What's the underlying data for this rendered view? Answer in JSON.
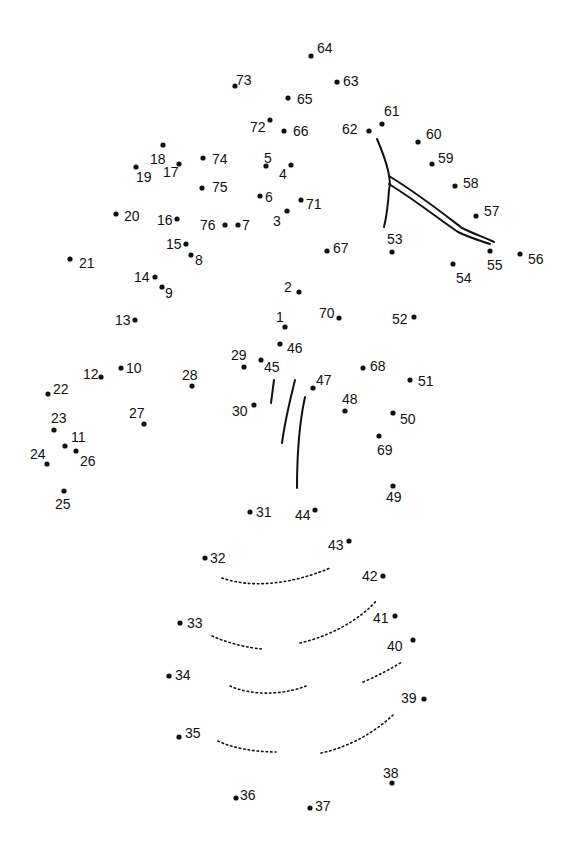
{
  "puzzle": {
    "type": "connect-the-dots",
    "subject_hint": "pineapple",
    "dots": [
      {
        "n": "1",
        "x": 285,
        "y": 327,
        "lx": 276,
        "ly": 322
      },
      {
        "n": "2",
        "x": 299,
        "y": 292,
        "lx": 284,
        "ly": 292
      },
      {
        "n": "3",
        "x": 287,
        "y": 211,
        "lx": 273,
        "ly": 226
      },
      {
        "n": "4",
        "x": 291,
        "y": 165,
        "lx": 279,
        "ly": 179
      },
      {
        "n": "5",
        "x": 266,
        "y": 166,
        "lx": 264,
        "ly": 163
      },
      {
        "n": "6",
        "x": 260,
        "y": 196,
        "lx": 265,
        "ly": 202
      },
      {
        "n": "7",
        "x": 238,
        "y": 225,
        "lx": 242,
        "ly": 230
      },
      {
        "n": "8",
        "x": 191,
        "y": 255,
        "lx": 195,
        "ly": 265
      },
      {
        "n": "9",
        "x": 162,
        "y": 287,
        "lx": 165,
        "ly": 298
      },
      {
        "n": "10",
        "x": 121,
        "y": 368,
        "lx": 126,
        "ly": 373
      },
      {
        "n": "11",
        "x": 65,
        "y": 446,
        "lx": 71,
        "ly": 442
      },
      {
        "n": "12",
        "x": 101,
        "y": 377,
        "lx": 83,
        "ly": 379
      },
      {
        "n": "13",
        "x": 135,
        "y": 320,
        "lx": 115,
        "ly": 325
      },
      {
        "n": "14",
        "x": 155,
        "y": 277,
        "lx": 134,
        "ly": 282
      },
      {
        "n": "15",
        "x": 186,
        "y": 244,
        "lx": 166,
        "ly": 249
      },
      {
        "n": "16",
        "x": 177,
        "y": 219,
        "lx": 157,
        "ly": 225
      },
      {
        "n": "17",
        "x": 179,
        "y": 164,
        "lx": 163,
        "ly": 177
      },
      {
        "n": "18",
        "x": 163,
        "y": 145,
        "lx": 150,
        "ly": 164
      },
      {
        "n": "19",
        "x": 136,
        "y": 167,
        "lx": 136,
        "ly": 182
      },
      {
        "n": "20",
        "x": 116,
        "y": 214,
        "lx": 124,
        "ly": 221
      },
      {
        "n": "21",
        "x": 70,
        "y": 259,
        "lx": 79,
        "ly": 268
      },
      {
        "n": "22",
        "x": 48,
        "y": 394,
        "lx": 53,
        "ly": 394
      },
      {
        "n": "23",
        "x": 54,
        "y": 430,
        "lx": 51,
        "ly": 423
      },
      {
        "n": "24",
        "x": 47,
        "y": 464,
        "lx": 30,
        "ly": 459
      },
      {
        "n": "25",
        "x": 64,
        "y": 491,
        "lx": 55,
        "ly": 509
      },
      {
        "n": "26",
        "x": 76,
        "y": 451,
        "lx": 80,
        "ly": 466
      },
      {
        "n": "27",
        "x": 144,
        "y": 424,
        "lx": 129,
        "ly": 418
      },
      {
        "n": "28",
        "x": 192,
        "y": 386,
        "lx": 182,
        "ly": 380
      },
      {
        "n": "29",
        "x": 244,
        "y": 367,
        "lx": 231,
        "ly": 360
      },
      {
        "n": "30",
        "x": 254,
        "y": 405,
        "lx": 232,
        "ly": 416
      },
      {
        "n": "31",
        "x": 250,
        "y": 512,
        "lx": 256,
        "ly": 517
      },
      {
        "n": "32",
        "x": 205,
        "y": 558,
        "lx": 210,
        "ly": 563
      },
      {
        "n": "33",
        "x": 180,
        "y": 623,
        "lx": 187,
        "ly": 628
      },
      {
        "n": "34",
        "x": 169,
        "y": 676,
        "lx": 175,
        "ly": 680
      },
      {
        "n": "35",
        "x": 179,
        "y": 737,
        "lx": 185,
        "ly": 738
      },
      {
        "n": "36",
        "x": 236,
        "y": 798,
        "lx": 240,
        "ly": 800
      },
      {
        "n": "37",
        "x": 310,
        "y": 808,
        "lx": 315,
        "ly": 811
      },
      {
        "n": "38",
        "x": 392,
        "y": 783,
        "lx": 383,
        "ly": 778
      },
      {
        "n": "39",
        "x": 424,
        "y": 699,
        "lx": 401,
        "ly": 703
      },
      {
        "n": "40",
        "x": 413,
        "y": 640,
        "lx": 387,
        "ly": 651
      },
      {
        "n": "41",
        "x": 395,
        "y": 616,
        "lx": 373,
        "ly": 623
      },
      {
        "n": "42",
        "x": 383,
        "y": 576,
        "lx": 362,
        "ly": 581
      },
      {
        "n": "43",
        "x": 349,
        "y": 541,
        "lx": 328,
        "ly": 550
      },
      {
        "n": "44",
        "x": 315,
        "y": 510,
        "lx": 295,
        "ly": 520
      },
      {
        "n": "45",
        "x": 261,
        "y": 360,
        "lx": 264,
        "ly": 372
      },
      {
        "n": "46",
        "x": 280,
        "y": 344,
        "lx": 287,
        "ly": 353
      },
      {
        "n": "47",
        "x": 313,
        "y": 388,
        "lx": 316,
        "ly": 385
      },
      {
        "n": "48",
        "x": 345,
        "y": 411,
        "lx": 342,
        "ly": 404
      },
      {
        "n": "49",
        "x": 393,
        "y": 486,
        "lx": 386,
        "ly": 502
      },
      {
        "n": "50",
        "x": 393,
        "y": 413,
        "lx": 400,
        "ly": 424
      },
      {
        "n": "51",
        "x": 410,
        "y": 380,
        "lx": 418,
        "ly": 386
      },
      {
        "n": "52",
        "x": 414,
        "y": 317,
        "lx": 392,
        "ly": 324
      },
      {
        "n": "53",
        "x": 392,
        "y": 252,
        "lx": 387,
        "ly": 244
      },
      {
        "n": "54",
        "x": 453,
        "y": 264,
        "lx": 456,
        "ly": 283
      },
      {
        "n": "55",
        "x": 490,
        "y": 251,
        "lx": 487,
        "ly": 270
      },
      {
        "n": "56",
        "x": 520,
        "y": 254,
        "lx": 528,
        "ly": 264
      },
      {
        "n": "57",
        "x": 476,
        "y": 216,
        "lx": 484,
        "ly": 216
      },
      {
        "n": "58",
        "x": 455,
        "y": 186,
        "lx": 463,
        "ly": 188
      },
      {
        "n": "59",
        "x": 432,
        "y": 164,
        "lx": 438,
        "ly": 163
      },
      {
        "n": "60",
        "x": 418,
        "y": 142,
        "lx": 426,
        "ly": 139
      },
      {
        "n": "61",
        "x": 382,
        "y": 124,
        "lx": 384,
        "ly": 116
      },
      {
        "n": "62",
        "x": 369,
        "y": 131,
        "lx": 342,
        "ly": 134
      },
      {
        "n": "63",
        "x": 337,
        "y": 82,
        "lx": 343,
        "ly": 86
      },
      {
        "n": "64",
        "x": 311,
        "y": 56,
        "lx": 317,
        "ly": 53
      },
      {
        "n": "65",
        "x": 288,
        "y": 98,
        "lx": 297,
        "ly": 104
      },
      {
        "n": "66",
        "x": 284,
        "y": 131,
        "lx": 293,
        "ly": 136
      },
      {
        "n": "67",
        "x": 327,
        "y": 251,
        "lx": 333,
        "ly": 253
      },
      {
        "n": "68",
        "x": 363,
        "y": 368,
        "lx": 370,
        "ly": 371
      },
      {
        "n": "69",
        "x": 379,
        "y": 436,
        "lx": 377,
        "ly": 455
      },
      {
        "n": "70",
        "x": 339,
        "y": 318,
        "lx": 319,
        "ly": 318
      },
      {
        "n": "71",
        "x": 301,
        "y": 200,
        "lx": 306,
        "ly": 209
      },
      {
        "n": "72",
        "x": 270,
        "y": 120,
        "lx": 250,
        "ly": 132
      },
      {
        "n": "73",
        "x": 235,
        "y": 86,
        "lx": 236,
        "ly": 85
      },
      {
        "n": "74",
        "x": 203,
        "y": 158,
        "lx": 212,
        "ly": 164
      },
      {
        "n": "75",
        "x": 202,
        "y": 188,
        "lx": 212,
        "ly": 192
      },
      {
        "n": "76",
        "x": 225,
        "y": 225,
        "lx": 200,
        "ly": 230
      }
    ]
  }
}
